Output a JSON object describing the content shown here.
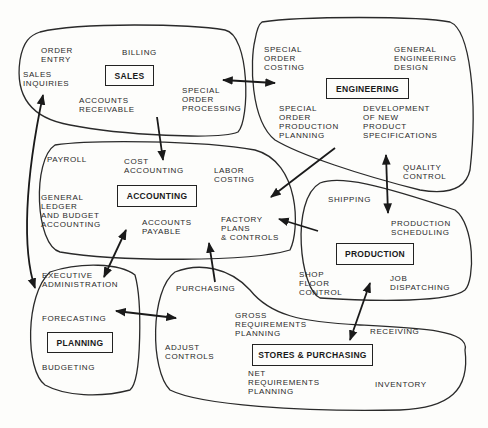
{
  "diagram": {
    "type": "functional area relationship diagram",
    "areas": [
      {
        "id": "sales",
        "title": "SALES",
        "functions": [
          "ORDER\nENTRY",
          "BILLING",
          "SALES\nINQUIRIES",
          "ACCOUNTS\nRECEIVABLE",
          "SPECIAL\nORDER\nPROCESSING"
        ]
      },
      {
        "id": "engineering",
        "title": "ENGINEERING",
        "functions": [
          "SPECIAL\nORDER\nCOSTING",
          "GENERAL\nENGINEERING\nDESIGN",
          "SPECIAL\nORDER\nPRODUCTION\nPLANNING",
          "DEVELOPMENT\nOF NEW\nPRODUCT\nSPECIFICATIONS",
          "QUALITY\nCONTROL"
        ]
      },
      {
        "id": "accounting",
        "title": "ACCOUNTING",
        "functions": [
          "PAYROLL",
          "COST\nACCOUNTING",
          "LABOR\nCOSTING",
          "GENERAL\nLEDGER\nAND BUDGET\nACCOUNTING",
          "ACCOUNTS\nPAYABLE",
          "FACTORY\nPLANS\n& CONTROLS"
        ]
      },
      {
        "id": "production",
        "title": "PRODUCTION",
        "functions": [
          "SHIPPING",
          "PRODUCTION\nSCHEDULING",
          "SHOP\nFLOOR\nCONTROL",
          "JOB\nDISPATCHING"
        ]
      },
      {
        "id": "planning",
        "title": "PLANNING",
        "functions": [
          "EXECUTIVE\nADMINISTRATION",
          "FORECASTING",
          "BUDGETING"
        ]
      },
      {
        "id": "stores",
        "title": "STORES & PURCHASING",
        "functions": [
          "PURCHASING",
          "GROSS\nREQUIREMENTS\nPLANNING",
          "RECEIVING",
          "ADJUST\nCONTROLS",
          "NET\nREQUIREMENTS\nPLANNING",
          "INVENTORY"
        ]
      }
    ],
    "connections": [
      {
        "from": "sales",
        "to": "engineering",
        "direction": "both"
      },
      {
        "from": "sales",
        "to": "accounting",
        "direction": "to"
      },
      {
        "from": "sales",
        "to": "planning",
        "direction": "both"
      },
      {
        "from": "engineering",
        "to": "accounting",
        "direction": "to"
      },
      {
        "from": "engineering",
        "to": "production",
        "direction": "both"
      },
      {
        "from": "production",
        "to": "accounting",
        "direction": "to"
      },
      {
        "from": "accounting",
        "to": "planning",
        "direction": "both"
      },
      {
        "from": "stores",
        "to": "accounting",
        "direction": "to"
      },
      {
        "from": "planning",
        "to": "stores",
        "direction": "both"
      },
      {
        "from": "stores",
        "to": "production",
        "direction": "both"
      }
    ],
    "colors": {
      "ink": "#222222",
      "paper": "#fdfdfb"
    }
  }
}
